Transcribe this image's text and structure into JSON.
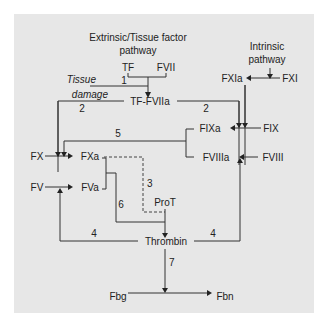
{
  "diagram": {
    "title_extrinsic": [
      "Extrinsic/Tissue factor",
      "pathway"
    ],
    "title_intrinsic": [
      "Intrinsic",
      "pathway"
    ],
    "nodes": {
      "tf": "TF",
      "fvii": "FVII",
      "tissue_damage": [
        "Tissue",
        "damage"
      ],
      "tf_fviia": "TF-FVIIa",
      "fxia": "FXIa",
      "fxi": "FXI",
      "fixa": "FIXa",
      "fix": "FIX",
      "fviiia": "FVIIIa",
      "fviii": "FVIII",
      "fx": "FX",
      "fxa": "FXa",
      "fv": "FV",
      "fva": "FVa",
      "prot": "ProT",
      "thrombin": "Thrombin",
      "fbg": "Fbg",
      "fbn": "Fbn"
    },
    "edge_labels": {
      "e1": "1",
      "e2_left": "2",
      "e2_right": "2",
      "e3": "3",
      "e4_left": "4",
      "e4_right": "4",
      "e5": "5",
      "e6": "6",
      "e7": "7"
    },
    "colors": {
      "panel": "#e7e7e7",
      "line": "#333333",
      "text": "#222222"
    }
  }
}
